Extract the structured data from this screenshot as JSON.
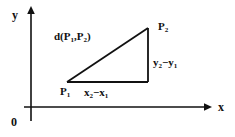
{
  "figure": {
    "axes": {
      "y_label": "y",
      "x_label": "x",
      "origin_label": "0"
    },
    "triangle": {
      "vertex_p1_label": "P",
      "vertex_p1_sub": "1",
      "vertex_p2_label": "P",
      "vertex_p2_sub": "2",
      "hypotenuse_label": "d(P",
      "hypotenuse_sub1": "1",
      "hypotenuse_mid": ",P",
      "hypotenuse_sub2": "2",
      "hypotenuse_end": ")",
      "vertical_leg_label": "y",
      "vertical_leg_sub1": "2",
      "vertical_leg_mid": "−y",
      "vertical_leg_sub2": "1",
      "horizontal_leg_label": "x",
      "horizontal_leg_sub1": "2",
      "horizontal_leg_mid": "−x",
      "horizontal_leg_sub2": "1"
    },
    "colors": {
      "ink": "#111111",
      "background": "#ffffff"
    }
  }
}
